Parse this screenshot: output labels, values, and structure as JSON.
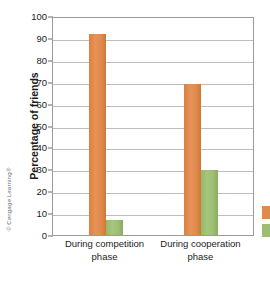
{
  "credit": "© Cengage Learning®",
  "chart_data": {
    "type": "bar",
    "title": "",
    "xlabel": "",
    "ylabel": "Percentage of friends",
    "categories": [
      "During competition phase",
      "During cooperation phase"
    ],
    "ylim": [
      0,
      100
    ],
    "yticks": [
      0,
      10,
      20,
      30,
      40,
      50,
      60,
      70,
      80,
      90,
      100
    ],
    "ytick_labels": [
      "0",
      "10",
      "20",
      "30",
      "40",
      "50",
      "60",
      "70",
      "80",
      "90",
      "100"
    ],
    "grid": "horizontal",
    "legend": "right-edge-clipped",
    "series": [
      {
        "name": "series-1",
        "color": "#e08a4e",
        "values": [
          92,
          69
        ]
      },
      {
        "name": "series-2",
        "color": "#9dbe72",
        "values": [
          7,
          29.5
        ]
      }
    ]
  }
}
